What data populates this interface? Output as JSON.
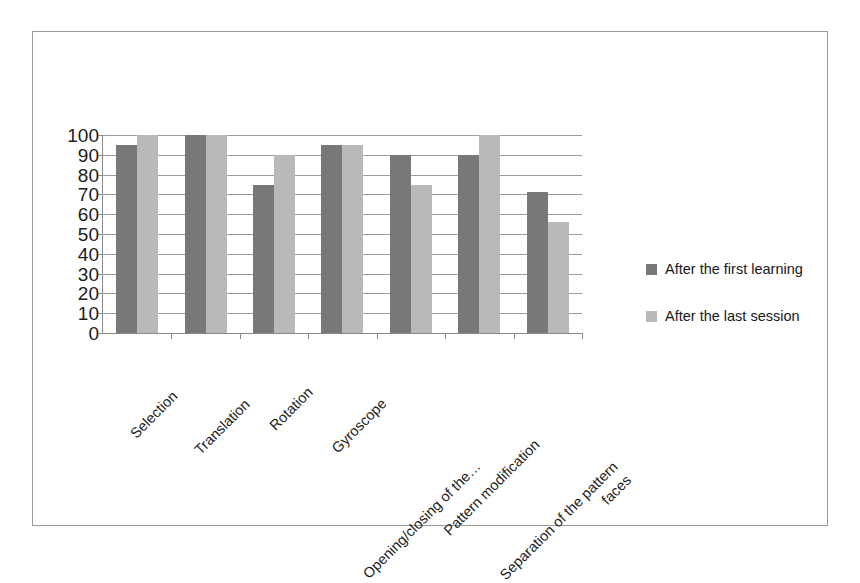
{
  "chart_data": {
    "type": "bar",
    "title": "",
    "xlabel": "",
    "ylabel": "",
    "ylim": [
      0,
      100
    ],
    "ytick_step": 10,
    "grid": true,
    "legend_position": "right",
    "categories": [
      "Selection",
      "Translation",
      "Rotation",
      "Gyroscope",
      "Opening/closing of the…",
      "Pattern modification",
      "Separation of the pattern\nfaces"
    ],
    "ytick_labels": [
      "100",
      "90",
      "80",
      "70",
      "60",
      "50",
      "40",
      "30",
      "20",
      "10",
      "0"
    ],
    "series": [
      {
        "name": "After the first learning",
        "color": "#787878",
        "values": [
          95,
          100,
          75,
          95,
          90,
          90,
          71
        ]
      },
      {
        "name": "After the last session",
        "color": "#b9b9b9",
        "values": [
          100,
          100,
          90,
          95,
          75,
          100,
          56
        ]
      }
    ]
  },
  "legend": {
    "items": [
      {
        "label": "After the first learning",
        "swatch": "#787878"
      },
      {
        "label": "After the last session",
        "swatch": "#b9b9b9"
      }
    ]
  }
}
